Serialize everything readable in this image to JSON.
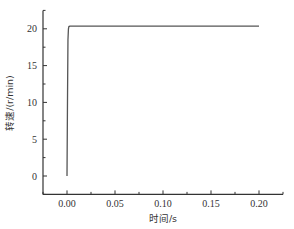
{
  "chart_data": {
    "type": "line",
    "title": "",
    "xlabel": "时间/s",
    "ylabel": "转速/(r/min)",
    "xlim": [
      -0.025,
      0.225
    ],
    "ylim": [
      -2.5,
      22.5
    ],
    "x_ticks": [
      0.0,
      0.05,
      0.1,
      0.15,
      0.2
    ],
    "x_tick_labels": [
      "0.00",
      "0.05",
      "0.10",
      "0.15",
      "0.20"
    ],
    "y_ticks": [
      0,
      5,
      10,
      15,
      20
    ],
    "y_tick_labels": [
      "0",
      "5",
      "10",
      "15",
      "20"
    ],
    "grid": false,
    "legend": null,
    "series": [
      {
        "name": "转速",
        "color": "#555555",
        "x": [
          0.0,
          0.0005,
          0.001,
          0.0015,
          0.002,
          0.003,
          0.05,
          0.1,
          0.15,
          0.2
        ],
        "y": [
          0.0,
          10.0,
          18.5,
          20.0,
          20.3,
          20.35,
          20.35,
          20.35,
          20.35,
          20.35
        ]
      }
    ]
  },
  "labels": {
    "xlabel": "时间/s",
    "ylabel": "转速/(r/min)"
  }
}
